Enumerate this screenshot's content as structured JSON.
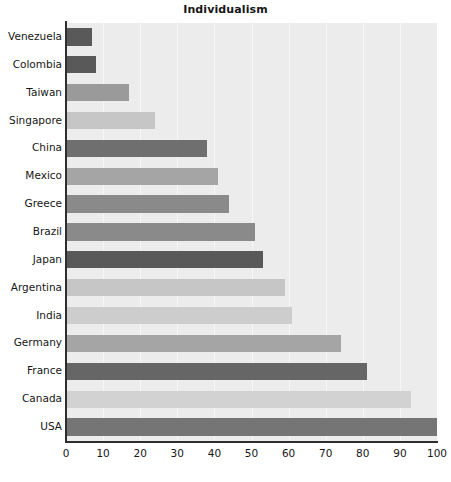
{
  "chart_data": {
    "type": "bar",
    "orientation": "horizontal",
    "title": "Individualism",
    "xlabel": "",
    "ylabel": "",
    "xlim": [
      0,
      100
    ],
    "xticks": [
      "0",
      "10",
      "20",
      "30",
      "40",
      "50",
      "60",
      "70",
      "80",
      "90",
      "100"
    ],
    "grid": "vertical",
    "legend": "none",
    "plot_background": "#ececec",
    "categories": [
      "Venezuela",
      "Colombia",
      "Taiwan",
      "Singapore",
      "China",
      "Mexico",
      "Greece",
      "Brazil",
      "Japan",
      "Argentina",
      "India",
      "Germany",
      "France",
      "Canada",
      "USA"
    ],
    "values": [
      7,
      8,
      17,
      24,
      38,
      41,
      44,
      51,
      53,
      59,
      61,
      74,
      81,
      93,
      100
    ],
    "bar_colors": [
      "#595959",
      "#595959",
      "#9a9a9a",
      "#c6c6c6",
      "#6f6f6f",
      "#a5a5a5",
      "#8a8a8a",
      "#8a8a8a",
      "#595959",
      "#c6c6c6",
      "#cdcdcd",
      "#a5a5a5",
      "#666666",
      "#d2d2d2",
      "#757575"
    ]
  }
}
